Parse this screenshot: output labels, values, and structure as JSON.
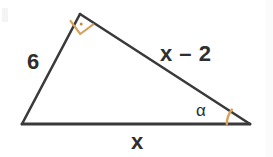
{
  "figure": {
    "kind": "right-triangle-geometry-diagram",
    "background_color": "#ffffff",
    "stroke_color": "#3a3a3a",
    "marker_color": "#d9a05b",
    "label_color": "#2e2e2e",
    "vertices": {
      "bottom_left": [
        22,
        124
      ],
      "apex": [
        80,
        14
      ],
      "bottom_right": [
        250,
        124
      ]
    },
    "labels": {
      "side_left": "6",
      "side_hypotenuse": "x – 2",
      "side_base": "x",
      "angle_alpha": "α"
    },
    "markers": {
      "right_angle_at": "apex",
      "right_angle_style": "square-with-center-dot",
      "angle_arc_at": "bottom_right"
    }
  }
}
